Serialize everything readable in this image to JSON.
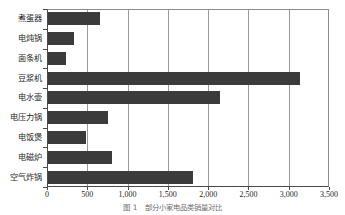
{
  "chart_data": {
    "type": "bar",
    "orientation": "horizontal",
    "title": "",
    "subtitle": "",
    "xlabel": "",
    "ylabel": "",
    "xlim": [
      0,
      3500
    ],
    "xtick_labels": [
      "0",
      "500",
      "1,000",
      "1,500",
      "2,000",
      "2,500",
      "3,000",
      "3,500"
    ],
    "xticks": [
      0,
      500,
      1000,
      1500,
      2000,
      2500,
      3000,
      3500
    ],
    "grid": "vertical",
    "legend": "none",
    "bar_color": "#3b3b3b",
    "grid_color": "#9a9a9a",
    "axis_color": "#4a4a4a",
    "categories": [
      "煮蛋器",
      "电炖锅",
      "面条机",
      "豆浆机",
      "电水壶",
      "电压力锅",
      "电饭煲",
      "电磁炉",
      "空气炸锅"
    ],
    "values": [
      660,
      340,
      240,
      3140,
      2150,
      760,
      490,
      810,
      1810
    ],
    "series": [
      {
        "name": "",
        "values": [
          660,
          340,
          240,
          3140,
          2150,
          760,
          490,
          810,
          1810
        ]
      }
    ]
  },
  "caption": {
    "text": "图 1　部分小家电品类销量对比"
  }
}
